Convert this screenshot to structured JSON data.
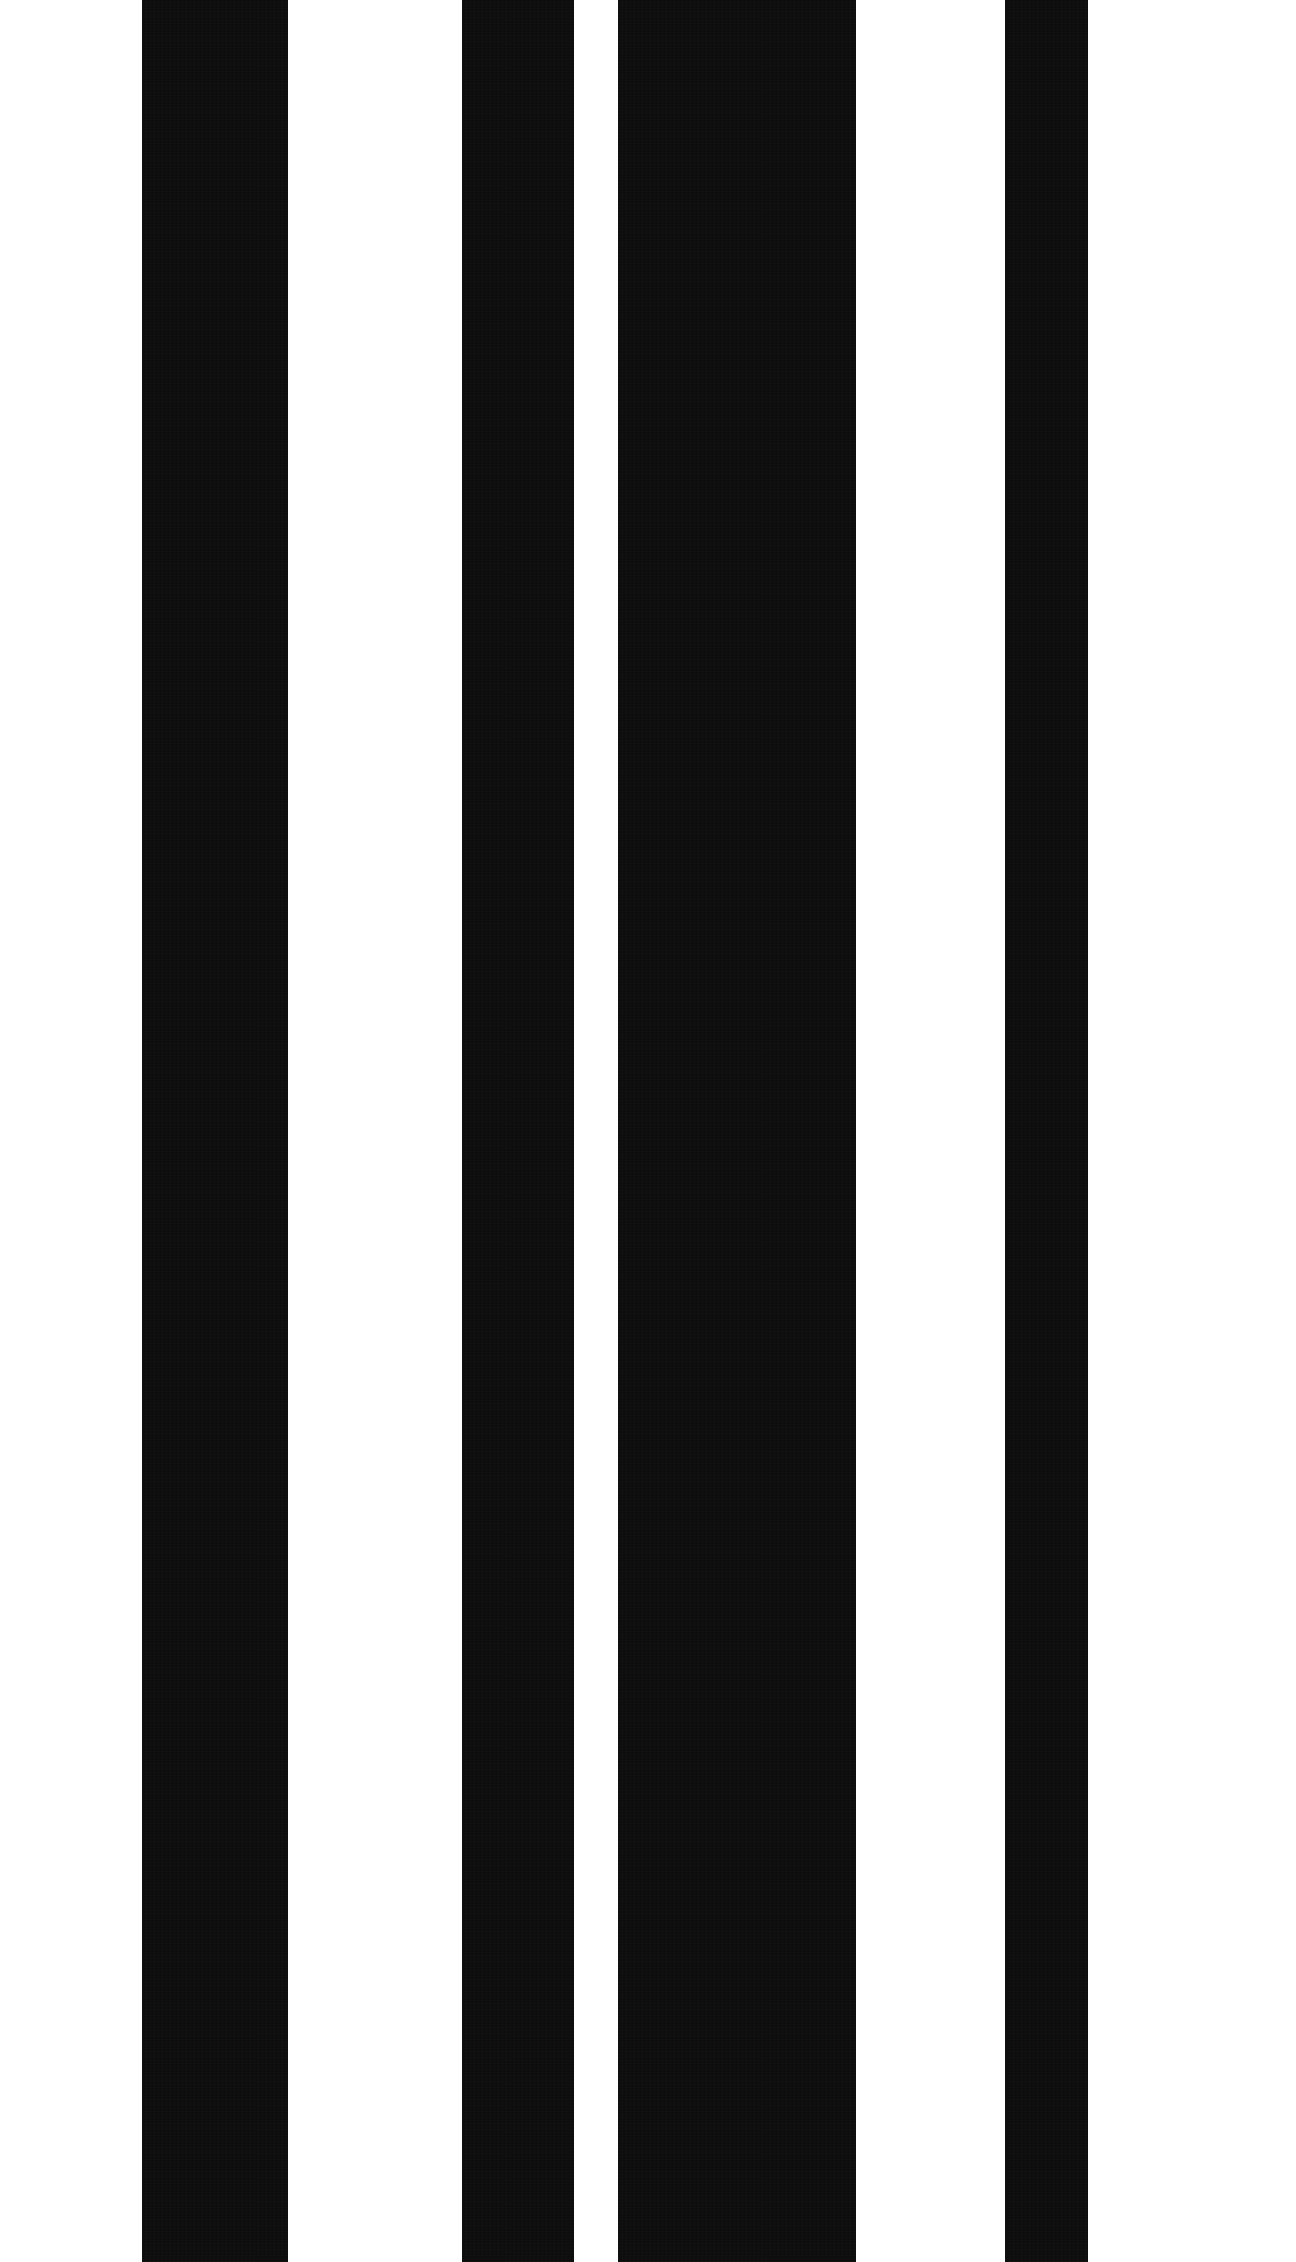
{
  "figure": {
    "title": "",
    "background_color": "#ffffff",
    "bar_color": "#0d0d0d",
    "width": 1296,
    "height": 2262
  },
  "chart_data": {
    "type": "bar",
    "orientation": "vertical",
    "title": "",
    "subtitle": "",
    "xlabel": "",
    "ylabel": "",
    "grid": false,
    "legend": null,
    "legend_position": "none",
    "axis_visible": false,
    "tick_labels_x": [],
    "tick_labels_y": [],
    "xlim": [
      0,
      1296
    ],
    "ylim": [
      0,
      2262
    ],
    "categories": [
      "Bar 1",
      "Bar 2",
      "Bar 3",
      "Bar 4"
    ],
    "values": [
      2262,
      2262,
      2262,
      2262
    ],
    "bar_widths": [
      146,
      112,
      238,
      83
    ],
    "bar_left_edges": [
      142,
      462,
      618,
      1005
    ],
    "bar_right_edges": [
      288,
      574,
      856,
      1088
    ],
    "gap_widths": [
      142,
      174,
      44,
      149,
      208
    ],
    "colors": [
      "#0d0d0d",
      "#0d0d0d",
      "#0d0d0d",
      "#0d0d0d"
    ],
    "annotations": []
  },
  "bars": [
    {
      "name": "bar-1",
      "left": 142,
      "width": 146,
      "top": 0,
      "height": 2262,
      "color": "#0d0d0d"
    },
    {
      "name": "bar-2",
      "left": 462,
      "width": 112,
      "top": 0,
      "height": 2262,
      "color": "#0d0d0d"
    },
    {
      "name": "bar-3",
      "left": 618,
      "width": 238,
      "top": 0,
      "height": 2262,
      "color": "#0d0d0d"
    },
    {
      "name": "bar-4",
      "left": 1005,
      "width": 83,
      "top": 0,
      "height": 2262,
      "color": "#0d0d0d"
    }
  ],
  "gaps": [
    {
      "name": "gap-left-margin",
      "left": 0,
      "width": 142
    },
    {
      "name": "gap-between-1-2",
      "left": 288,
      "width": 174
    },
    {
      "name": "gap-between-2-3",
      "left": 574,
      "width": 44
    },
    {
      "name": "gap-between-3-4",
      "left": 856,
      "width": 149
    },
    {
      "name": "gap-right-margin",
      "left": 1088,
      "width": 208
    }
  ]
}
